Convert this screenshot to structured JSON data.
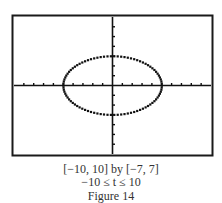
{
  "chart_data": {
    "type": "line",
    "title": "",
    "parametric": {
      "x": "5cos(t)",
      "y": "3sin(t)",
      "t_range": [
        -10,
        10
      ]
    },
    "xlim": [
      -10,
      10
    ],
    "ylim": [
      -7,
      7
    ],
    "xtick_step": 1,
    "ytick_step": 1,
    "grid": false,
    "series": [
      {
        "name": "ellipse",
        "semi_axis_x": 5,
        "semi_axis_y": 3,
        "center": [
          0,
          0
        ]
      }
    ],
    "xlabel": "",
    "ylabel": ""
  },
  "caption": {
    "window": "[−10, 10] by [−7, 7]",
    "t_range": "−10 ≤ t ≤ 10",
    "figure": "Figure 14"
  },
  "colors": {
    "ink": "#111111",
    "frame": "#1a1a1a",
    "background": "#ffffff"
  }
}
